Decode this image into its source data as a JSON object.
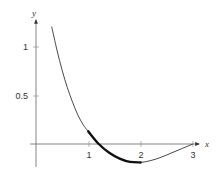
{
  "chart_data": {
    "type": "line",
    "title": "",
    "xlabel": "x",
    "ylabel": "y",
    "xlim": [
      -0.1,
      3.2
    ],
    "ylim": [
      -0.24,
      1.35
    ],
    "grid": false,
    "legend": null,
    "x_ticks": [
      {
        "value": 1,
        "label": "1"
      },
      {
        "value": 2,
        "label": "2"
      },
      {
        "value": 3,
        "label": "3"
      }
    ],
    "y_ticks": [
      {
        "value": 0.5,
        "label": "0.5"
      },
      {
        "value": 1,
        "label": "1"
      }
    ],
    "series": [
      {
        "name": "curve",
        "style": "thin",
        "x": [
          0.3,
          0.4,
          0.5,
          0.6,
          0.7,
          0.8,
          0.9,
          1.0,
          1.2,
          1.4,
          1.6,
          1.8,
          2.0,
          2.2,
          2.4,
          2.6,
          2.8,
          3.0
        ],
        "y": [
          1.21,
          0.97,
          0.76,
          0.58,
          0.43,
          0.3,
          0.2,
          0.13,
          0.0,
          -0.09,
          -0.15,
          -0.185,
          -0.19,
          -0.17,
          -0.135,
          -0.09,
          -0.045,
          0.0
        ]
      },
      {
        "name": "highlighted segment",
        "style": "thick",
        "x": [
          1.0,
          1.2,
          1.4,
          1.6,
          1.8,
          2.0
        ],
        "y": [
          0.13,
          0.0,
          -0.09,
          -0.15,
          -0.185,
          -0.19
        ]
      }
    ]
  },
  "labels": {
    "x_axis": "x",
    "y_axis": "y",
    "x_tick_1": "1",
    "x_tick_2": "2",
    "x_tick_3": "3",
    "y_tick_05": "0.5",
    "y_tick_1": "1"
  },
  "colors": {
    "axis": "#555555",
    "curve": "#333333",
    "highlight": "#111111"
  }
}
